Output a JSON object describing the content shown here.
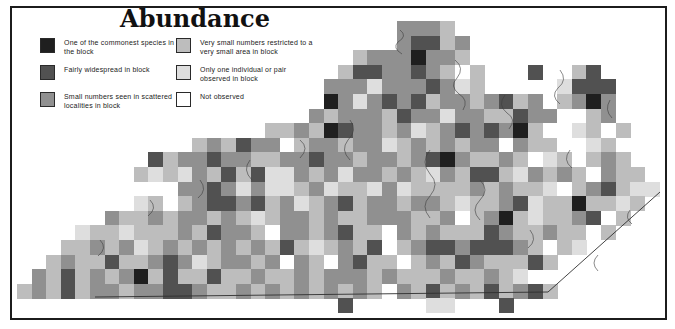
{
  "figure": {
    "title": "Abundance"
  },
  "legend": {
    "items": [
      {
        "key": "5",
        "label": "One of the commonest species in the block"
      },
      {
        "key": "4",
        "label": "Fairly widespread in block"
      },
      {
        "key": "3",
        "label": "Small numbers seen in scattered localities in block"
      },
      {
        "key": "2",
        "label": "Very small numbers restricted to a very small area in block"
      },
      {
        "key": "1",
        "label": "Only one individual or pair observed in block"
      },
      {
        "key": "0",
        "label": "Not observed"
      }
    ]
  },
  "map": {
    "palette": {
      "5": "#1f1f1f",
      "4": "#515151",
      "3": "#909090",
      "2": "#bdbdbd",
      "1": "#dedede",
      "0": "#ffffff"
    },
    "grid": [
      "..........................3332..............",
      "..........................34423.............",
      ".......................23335332.............",
      "......................2443343202...4..24....",
      ".....................33313334312.....1444...",
      ".....................53134342332342302353...",
      "....................3233324331332243300230..",
      ".................2232543323123434352001202..",
      "............232433023323312323233032200120..",
      ".........423343322334332332345322320120232..",
      "........21213242411323133232132442132320322.",
      "......00000334313112312213122223232210234211",
      "......0012023443423123423323321223412252212.",
      "......3223233232123323223332230235212234 2..",
      "....1221222324332033234220323222432232202...",
      "...223231232323232421232402344344432021.....",
      "..23224223431233230320342202324322242.......",
      ".3242323524224223223233323222322321.........",
      "2324233233443223232323232032423242342.......",
      "......................4.....11...4.........."
    ]
  }
}
